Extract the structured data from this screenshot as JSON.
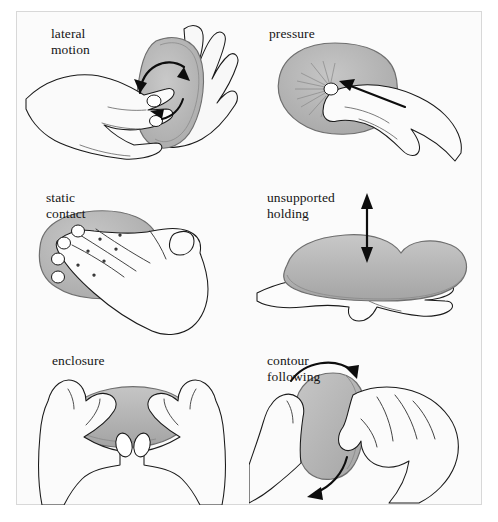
{
  "figure": {
    "type": "illustration-plate",
    "background_color": "#fbfbfb",
    "frame_color": "#d8d8d8",
    "ink_color": "#1a1a1a",
    "object_fill_color": "#b4b4b4",
    "hand_fill_color": "#f7f7f7",
    "layout": {
      "columns": 2,
      "rows": 3
    }
  },
  "panels": [
    {
      "id": "lateral-motion",
      "label": "lateral\nmotion",
      "label_line1": "lateral",
      "label_line2": "motion",
      "arrows": "curved double-headed rotation arrow over object",
      "hands": 2
    },
    {
      "id": "pressure",
      "label": "pressure",
      "label_line1": "pressure",
      "label_line2": "",
      "arrows": "straight arrow pointing into object surface",
      "hands": 1
    },
    {
      "id": "static-contact",
      "label": "static\ncontact",
      "label_line1": "static",
      "label_line2": "contact",
      "arrows": "none",
      "hands": 1
    },
    {
      "id": "unsupported-holding",
      "label": "unsupported\nholding",
      "label_line1": "unsupported",
      "label_line2": "holding",
      "arrows": "vertical double-headed arrow above object",
      "hands": 1
    },
    {
      "id": "enclosure",
      "label": "enclosure",
      "label_line1": "enclosure",
      "label_line2": "",
      "arrows": "none",
      "hands": 2
    },
    {
      "id": "contour-following",
      "label": "contour\nfollowing",
      "label_line1": "contour",
      "label_line2": "following",
      "arrows": "two curved arrows tracing object edge",
      "hands": 2
    }
  ]
}
